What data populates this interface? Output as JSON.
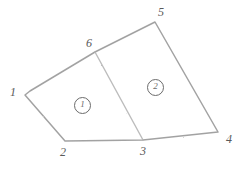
{
  "figure": {
    "background_color": "#ffffff",
    "line_color": "#9a9a9a",
    "label_color": "#5a5a5a",
    "width": 243,
    "height": 169
  },
  "vertices": [
    {
      "id": "1",
      "label": "1",
      "x": 25,
      "y": 95,
      "label_x": 10,
      "label_y": 86
    },
    {
      "id": "2",
      "label": "2",
      "x": 65,
      "y": 141,
      "label_x": 60,
      "label_y": 146
    },
    {
      "id": "3",
      "label": "3",
      "x": 143,
      "y": 140,
      "label_x": 140,
      "label_y": 145
    },
    {
      "id": "4",
      "label": "4",
      "x": 218,
      "y": 132,
      "label_x": 226,
      "label_y": 133
    },
    {
      "id": "5",
      "label": "5",
      "x": 155,
      "y": 22,
      "label_x": 158,
      "label_y": 6
    },
    {
      "id": "6",
      "label": "6",
      "x": 95,
      "y": 52,
      "label_x": 86,
      "label_y": 37
    }
  ],
  "outline": {
    "name": "parcel-outline",
    "path": "M 25 95 L 30 91 L 95 52 L 155 22 L 218 132 L 143 140 L 65 141 Z",
    "closed": true
  },
  "divider": {
    "name": "parcel-divider",
    "from": "6",
    "to": "3",
    "path": "M 95 52 L 143 140"
  },
  "regions": [
    {
      "id": "left",
      "label": "1",
      "name": "region-label-left",
      "center_x": 82,
      "center_y": 105,
      "bounded_by": [
        "1",
        "2",
        "3",
        "6"
      ]
    },
    {
      "id": "right",
      "label": "2",
      "name": "region-label-right",
      "center_x": 155,
      "center_y": 87,
      "bounded_by": [
        "6",
        "5",
        "4",
        "3"
      ]
    }
  ]
}
